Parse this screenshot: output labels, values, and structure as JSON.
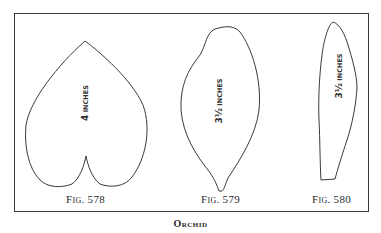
{
  "caption": "Orchid",
  "figures": [
    {
      "label": "Fig. 578",
      "label_prefix": "Fig.",
      "number": "578",
      "measure_value": "4",
      "measure_unit": "inches",
      "shape": "heart-shaped leaf / petal"
    },
    {
      "label": "Fig. 579",
      "label_prefix": "Fig.",
      "number": "579",
      "measure_value": "3½",
      "measure_unit": "inches",
      "shape": "oval petal with pointed base"
    },
    {
      "label": "Fig. 580",
      "label_prefix": "Fig.",
      "number": "580",
      "measure_value": "3½",
      "measure_unit": "inches",
      "shape": "narrow strap petal"
    }
  ],
  "colors": {
    "line": "#3a3a3a",
    "background": "#ffffff",
    "text": "#2a2a2a"
  }
}
